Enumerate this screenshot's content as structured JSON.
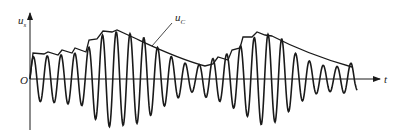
{
  "figure": {
    "y_axis_label": "u",
    "y_axis_subscript": "s",
    "x_axis_label": "t",
    "origin_label": "O",
    "envelope_label": "u",
    "envelope_subscript": "C",
    "colors": {
      "line": "#1a1a1a",
      "background": "#ffffff"
    }
  }
}
